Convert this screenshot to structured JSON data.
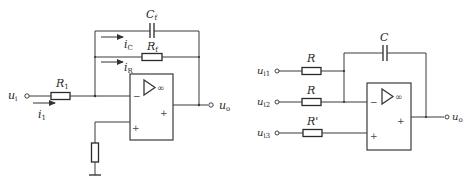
{
  "figures": [
    {
      "id": "left",
      "type": "inverting-integrator-with-resistive-feedback",
      "labels": {
        "input": "u",
        "input_sub": "i",
        "output": "u",
        "output_sub": "o",
        "input_resistor": "R",
        "input_resistor_sub": "1",
        "feedback_capacitor": "C",
        "feedback_capacitor_sub": "f",
        "feedback_resistor": "R",
        "feedback_resistor_sub": "f",
        "current_input": "i",
        "current_input_sub": "1",
        "current_cap": "i",
        "current_cap_sub": "C",
        "current_res": "i",
        "current_res_sub": "R",
        "opamp_gain": "∞",
        "inverting_sign": "−",
        "noninverting_sign": "+",
        "output_sign": "+"
      }
    },
    {
      "id": "right",
      "type": "summing-integrator",
      "labels": {
        "input1": "u",
        "input1_sub": "i1",
        "input2": "u",
        "input2_sub": "i2",
        "input3": "u",
        "input3_sub": "i3",
        "output": "u",
        "output_sub": "o",
        "resistor1": "R",
        "resistor2": "R",
        "resistor3": "R'",
        "capacitor": "C",
        "opamp_gain": "∞",
        "inverting_sign": "−",
        "noninverting_sign": "+",
        "output_sign": "+"
      }
    }
  ]
}
